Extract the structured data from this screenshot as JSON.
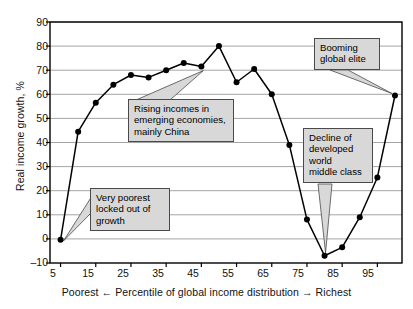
{
  "chart_data": {
    "type": "line",
    "title": "",
    "subtitle": "",
    "xlabel": "Poorest ← Percentile of global income distribution → Richest",
    "ylabel": "Real income growth, %",
    "xlim": [
      2,
      102
    ],
    "ylim": [
      -10,
      90
    ],
    "xticks": [
      5,
      15,
      25,
      35,
      45,
      55,
      65,
      75,
      85,
      95
    ],
    "yticks": [
      -10,
      0,
      10,
      20,
      30,
      40,
      50,
      60,
      70,
      80,
      90
    ],
    "grid": "horizontal",
    "legend": "none",
    "marker": "filled-circle",
    "line_color": "#000000",
    "grid_color": "#9a9a9a",
    "series": [
      {
        "name": "Real income growth 1988-2008",
        "x": [
          5,
          10,
          15,
          20,
          25,
          30,
          35,
          40,
          45,
          50,
          55,
          60,
          65,
          70,
          75,
          80,
          85,
          90,
          95,
          100
        ],
        "values": [
          -0.4,
          44.5,
          56.5,
          64,
          68,
          67,
          70,
          73,
          71.5,
          80,
          65,
          70.5,
          60,
          39,
          8,
          -7,
          -3.5,
          9,
          25.5,
          59.5
        ]
      }
    ],
    "annotations": [
      {
        "id": "rising",
        "text": "Rising incomes in\nemerging economies,\nmainly China",
        "points_to": {
          "x": 45,
          "y": 71.5
        }
      },
      {
        "id": "poorest",
        "text": "Very poorest\nlocked out of\ngrowth",
        "points_to": {
          "x": 5,
          "y": -0.4
        }
      },
      {
        "id": "elite",
        "text": "Booming\nglobal elite",
        "points_to": {
          "x": 100,
          "y": 59.5
        }
      },
      {
        "id": "decline",
        "text": "Decline of\ndeveloped\nworld\nmiddle class",
        "points_to": {
          "x": 80,
          "y": -7
        }
      }
    ]
  },
  "axes": {
    "ylabel": "Real income growth, %",
    "xlabel": "Poorest ← Percentile of global income distribution → Richest",
    "ytick_labels": [
      "90",
      "80",
      "70",
      "60",
      "50",
      "40",
      "30",
      "20",
      "10",
      "0",
      "–10"
    ],
    "xtick_labels": [
      "5",
      "15",
      "25",
      "35",
      "45",
      "55",
      "65",
      "75",
      "85",
      "95"
    ]
  },
  "callouts": {
    "rising": "Rising incomes in\nemerging economies,\nmainly China",
    "poorest": "Very poorest\nlocked out of\ngrowth",
    "elite": "Booming\nglobal elite",
    "decline": "Decline of\ndeveloped\nworld\nmiddle class"
  }
}
